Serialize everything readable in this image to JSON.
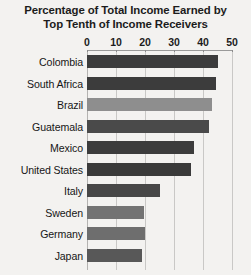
{
  "chart_data": {
    "type": "bar",
    "orientation": "horizontal",
    "title": "Percentage of Total Income Earned by Top Tenth of Income Receivers",
    "title_lines": [
      "Percentage of Total Income Earned by",
      "Top Tenth of Income Receivers"
    ],
    "xlabel": "",
    "ylabel": "",
    "xlim": [
      0,
      50
    ],
    "xticks": [
      0,
      10,
      20,
      30,
      40,
      50
    ],
    "xtick_labels": [
      "0",
      "10",
      "20",
      "30",
      "40",
      "50"
    ],
    "grid": true,
    "grid_axis": "x",
    "legend": false,
    "categories": [
      "Colombia",
      "South Africa",
      "Brazil",
      "Guatemala",
      "Mexico",
      "United States",
      "Italy",
      "Sweden",
      "Germany",
      "Japan"
    ],
    "values": [
      45,
      44.5,
      43,
      42,
      37,
      36,
      25,
      19.5,
      20,
      19
    ],
    "bar_colors": [
      "#3c3c3c",
      "#3c3c3c",
      "#8e8e8e",
      "#4a4a4a",
      "#3c3c3c",
      "#3a3a3a",
      "#474747",
      "#737373",
      "#6e6e6e",
      "#585858"
    ],
    "bars": [
      {
        "label": "Colombia",
        "value": 45,
        "color": "#3c3c3c"
      },
      {
        "label": "South Africa",
        "value": 44.5,
        "color": "#3c3c3c"
      },
      {
        "label": "Brazil",
        "value": 43,
        "color": "#8e8e8e"
      },
      {
        "label": "Guatemala",
        "value": 42,
        "color": "#4a4a4a"
      },
      {
        "label": "Mexico",
        "value": 37,
        "color": "#3c3c3c"
      },
      {
        "label": "United States",
        "value": 36,
        "color": "#3a3a3a"
      },
      {
        "label": "Italy",
        "value": 25,
        "color": "#474747"
      },
      {
        "label": "Sweden",
        "value": 19.5,
        "color": "#737373"
      },
      {
        "label": "Germany",
        "value": 20,
        "color": "#6e6e6e"
      },
      {
        "label": "Japan",
        "value": 19,
        "color": "#585858"
      }
    ]
  },
  "style": {
    "background": "#f3f2f0",
    "grid_color": "#c9c8c6",
    "axis_color": "#9a9a9a",
    "text_color": "#1c1c1c"
  }
}
